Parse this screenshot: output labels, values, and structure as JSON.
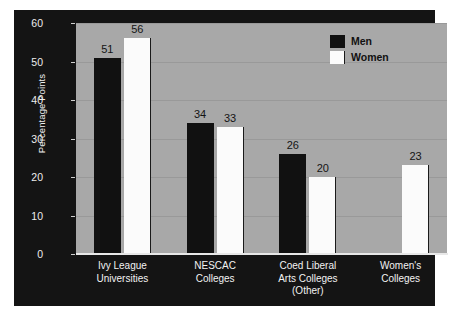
{
  "chart_data": {
    "type": "bar",
    "title": "",
    "xlabel": "",
    "ylabel": "Percentage Points",
    "ylim": [
      0,
      60
    ],
    "ytick_values": [
      60,
      50,
      40,
      30,
      20,
      10,
      0
    ],
    "ytick_labels": [
      "60",
      "50",
      "40",
      "30",
      "20",
      "10",
      "0"
    ],
    "grid": true,
    "grid_axis": "y",
    "legend_position": "top-right",
    "categories": [
      "Ivy League Universities",
      "NESCAC Colleges",
      "Coed Liberal Arts Colleges (Other)",
      "Women's Colleges"
    ],
    "category_lines": [
      [
        "Ivy League",
        "Universities"
      ],
      [
        "NESCAC",
        "Colleges"
      ],
      [
        "Coed Liberal",
        "Arts Colleges",
        "(Other)"
      ],
      [
        "Women's",
        "Colleges"
      ]
    ],
    "series": [
      {
        "name": "Men",
        "color": "#111111",
        "values": [
          51,
          34,
          26,
          null
        ],
        "value_labels": [
          "51",
          "34",
          "26",
          ""
        ]
      },
      {
        "name": "Women",
        "color": "#fbfbfb",
        "values": [
          56,
          33,
          20,
          23
        ],
        "value_labels": [
          "56",
          "33",
          "20",
          "23"
        ]
      }
    ]
  },
  "legend": {
    "items": [
      {
        "label": "Men",
        "swatch": "men"
      },
      {
        "label": "Women",
        "swatch": "women"
      }
    ]
  },
  "axes": {
    "y_label": "Percentage Points",
    "y_ticks": [
      "60",
      "50",
      "40",
      "30",
      "20",
      "10",
      "0"
    ]
  },
  "colors": {
    "panel_background": "#141414",
    "plot_background": "#a8a8a8",
    "gridline": "#999999",
    "men_bar": "#111111",
    "women_bar": "#fbfbfb",
    "axis_text": "#ededed",
    "value_text": "#141414",
    "page_background": "#ffffff"
  }
}
